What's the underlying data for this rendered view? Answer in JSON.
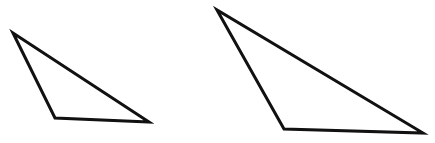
{
  "figure": {
    "title": "",
    "background_color": "#ffffff",
    "stroke_color": "#111111",
    "stroke_width": 3,
    "canvas": {
      "width": 435,
      "height": 143
    },
    "shapes": [
      {
        "name": "small-triangle",
        "type": "triangle",
        "fill": "none",
        "label": "",
        "vertices": [
          {
            "name": "apex",
            "x": 13,
            "y": 33
          },
          {
            "name": "bottom-left",
            "x": 55,
            "y": 118
          },
          {
            "name": "bottom-right",
            "x": 149,
            "y": 122
          }
        ],
        "points": "13,33 55,118 149,122"
      },
      {
        "name": "large-triangle",
        "type": "triangle",
        "fill": "none",
        "label": "",
        "vertices": [
          {
            "name": "apex",
            "x": 217,
            "y": 10
          },
          {
            "name": "bottom-left",
            "x": 284,
            "y": 129
          },
          {
            "name": "bottom-right",
            "x": 423,
            "y": 133
          }
        ],
        "points": "217,10 284,129 423,133"
      }
    ]
  }
}
